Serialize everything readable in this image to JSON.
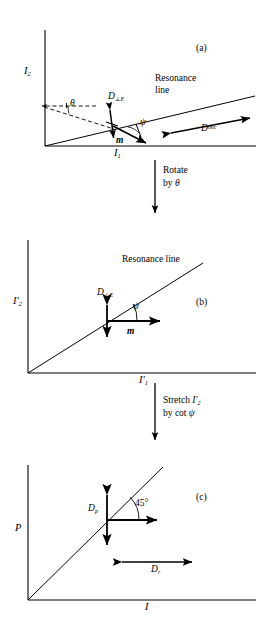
{
  "figure": {
    "background_color": "#ffffff",
    "line_color": "#000000"
  },
  "panels": [
    {
      "tag": "(a)",
      "y_axis_label_base": "I",
      "y_axis_label_sub": "2",
      "x_axis_label_base": "I",
      "x_axis_label_sub": "1",
      "resonance_label_line1": "Resonance",
      "resonance_label_line2": "line",
      "perp_vector_base": "D",
      "perp_vector_sub": "⊥E",
      "m_vector": "m",
      "psi_symbol": "ψ",
      "theta_symbol": "θ",
      "onc_vector_base": "D",
      "onc_vector_sup": "onc"
    },
    {
      "tag": "(b)",
      "y_axis_label_base": "I",
      "y_axis_label_prime": "′",
      "y_axis_label_sub": "2",
      "x_axis_label_base": "I",
      "x_axis_label_prime": "′",
      "x_axis_label_sub": "1",
      "resonance_label": "Resonance line",
      "perp_vector_base": "D",
      "perp_vector_sub": "⊥E",
      "m_vector": "m",
      "psi_symbol": "ψ"
    },
    {
      "tag": "(c)",
      "y_axis_label": "P",
      "x_axis_label": "I",
      "dp_vector_base": "D",
      "dp_vector_sub": "p",
      "dr_vector_base": "D",
      "dr_vector_sub": "r",
      "angle_label": "45°"
    }
  ],
  "connectors": [
    {
      "line1": "Rotate",
      "line2_prefix": "by ",
      "line2_symbol": "θ"
    },
    {
      "line1_prefix": "Stretch ",
      "line1_symbol_base": "I",
      "line1_symbol_prime": "′",
      "line1_symbol_sub": "2",
      "line2_prefix": "by cot ",
      "line2_symbol": "ψ"
    }
  ]
}
